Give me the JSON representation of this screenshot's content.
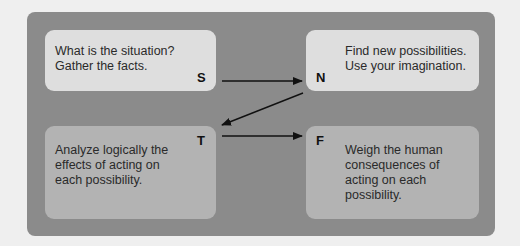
{
  "diagram": {
    "type": "process-flow",
    "boxes": [
      {
        "id": "S",
        "letter": "S",
        "text": "What is the situation?\nGather the facts."
      },
      {
        "id": "N",
        "letter": "N",
        "text": "Find new possibilities.\nUse your imagination."
      },
      {
        "id": "T",
        "letter": "T",
        "text": "Analyze logically the\neffects of acting on\neach possibility."
      },
      {
        "id": "F",
        "letter": "F",
        "text": "Weigh the human\nconsequences of\nacting on each\npossibility."
      }
    ],
    "arrows": [
      {
        "from": "S",
        "to": "N"
      },
      {
        "from": "N",
        "to": "T"
      },
      {
        "from": "T",
        "to": "F"
      }
    ],
    "colors": {
      "background": "#efefef",
      "panel": "#8b8b8b",
      "top_box": "#dedede",
      "bottom_box": "#b3b3b3",
      "arrow": "#111111"
    }
  }
}
